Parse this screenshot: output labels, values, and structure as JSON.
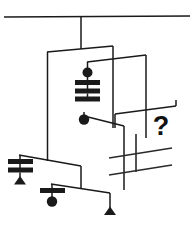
{
  "figure": {
    "unknown_marker": "?",
    "ceiling": {
      "y": 17,
      "x_start": 4,
      "x_end": 190
    },
    "colors": {
      "ink": "#1a1a1a",
      "background": "#ffffff",
      "question_mark": "#111111"
    },
    "weights": [
      {
        "id": "w1",
        "shape": "circle",
        "label": "circle-weight-upper",
        "count": 1
      },
      {
        "id": "w2",
        "shape": "bar-stack",
        "label": "three-bar-stack",
        "count": 3
      },
      {
        "id": "w3",
        "shape": "circle",
        "label": "circle-weight-middle",
        "count": 1
      },
      {
        "id": "w4",
        "shape": "bar-stack",
        "label": "two-bar-stack",
        "count": 2
      },
      {
        "id": "w5",
        "shape": "triangle",
        "label": "triangle-weight-left",
        "count": 1
      },
      {
        "id": "w6",
        "shape": "bar-stack",
        "label": "one-bar-stack",
        "count": 1
      },
      {
        "id": "w7",
        "shape": "circle",
        "label": "circle-weight-lower",
        "count": 1
      },
      {
        "id": "w8",
        "shape": "triangle",
        "label": "triangle-weight-bottom",
        "count": 1
      },
      {
        "id": "w9",
        "shape": "thin-bar",
        "label": "thin-bar-upper-right",
        "count": 1
      },
      {
        "id": "w10",
        "shape": "thin-bar",
        "label": "thin-bar-lower-right",
        "count": 1
      }
    ],
    "levels": [
      {
        "id": "rod-1",
        "name": "top-crossbar",
        "pivot_x": 81,
        "left_x": 48,
        "right_x": 113
      },
      {
        "id": "rod-2",
        "name": "second-crossbar",
        "pivot_x": 113,
        "left_x": 88,
        "right_x": 146
      },
      {
        "id": "rod-3",
        "name": "right-crossbar",
        "pivot_x": 146,
        "left_x": 115,
        "right_x": 176
      },
      {
        "id": "rod-4",
        "name": "stack-crossbar",
        "pivot_x": 88,
        "left_x": 84,
        "right_x": 124
      },
      {
        "id": "rod-5",
        "name": "lower-left-crossbar",
        "pivot_x": 48,
        "left_x": 20,
        "right_x": 81
      },
      {
        "id": "rod-6",
        "name": "bottom-crossbar",
        "pivot_x": 81,
        "left_x": 52,
        "right_x": 110
      },
      {
        "id": "rod-7",
        "name": "thin-rod-pair",
        "pivot_x": 136,
        "left_x": 108,
        "right_x": 172
      }
    ]
  }
}
